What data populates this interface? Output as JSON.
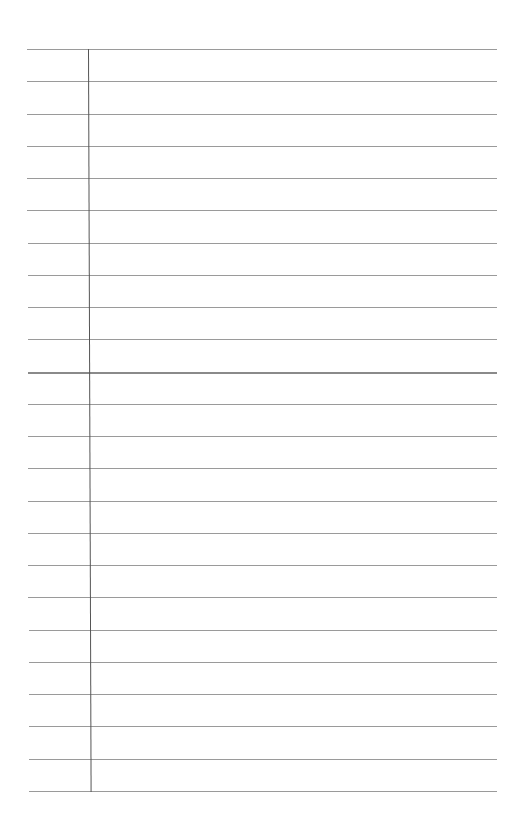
{
  "page": {
    "type": "lined-paper",
    "line_count": 24,
    "line_color": "#9a9a9a",
    "margin_color": "#555555",
    "background": "#ffffff"
  }
}
